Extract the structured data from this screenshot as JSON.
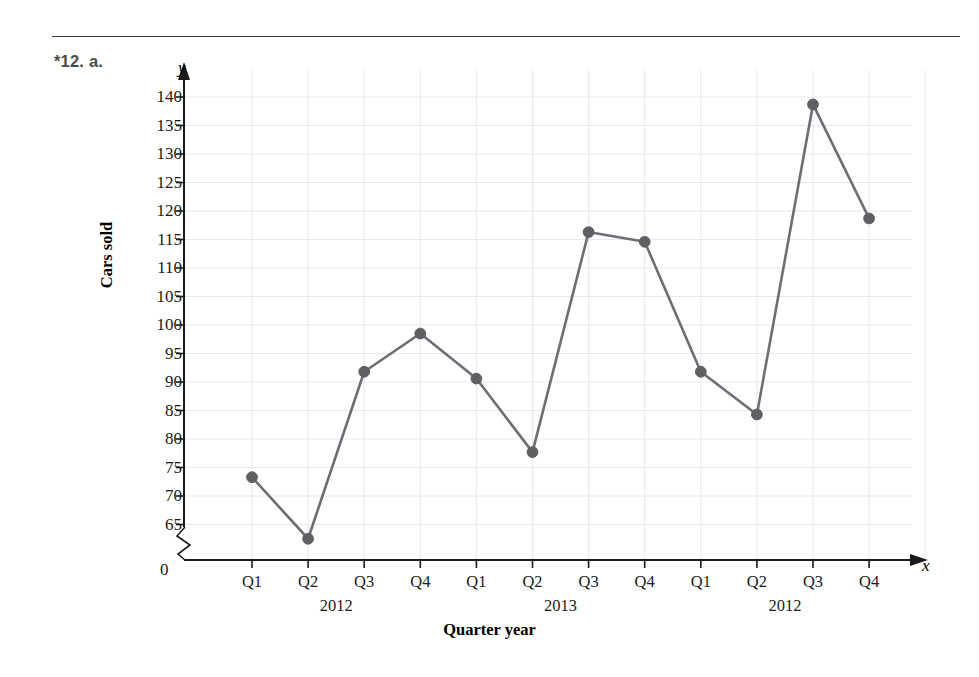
{
  "label": "*12. a.",
  "chart_data": {
    "type": "line",
    "title": "",
    "xlabel": "Quarter year",
    "ylabel": "Cars sold",
    "categories": [
      "Q1",
      "Q2",
      "Q3",
      "Q4",
      "Q1",
      "Q2",
      "Q3",
      "Q4",
      "Q1",
      "Q2",
      "Q3",
      "Q4"
    ],
    "values": [
      73.3,
      62.5,
      91.8,
      98.5,
      90.6,
      77.7,
      116.3,
      114.6,
      91.8,
      84.3,
      138.7,
      118.7
    ],
    "group_labels": [
      "2012",
      "2013",
      "2012"
    ],
    "ylim": [
      65,
      142
    ],
    "yticks": [
      65,
      70,
      75,
      80,
      85,
      90,
      95,
      100,
      105,
      110,
      115,
      120,
      125,
      130,
      135,
      140
    ],
    "origin_label": "0",
    "axis_letter_x": "x",
    "axis_letter_y": "y",
    "grid": true,
    "legend": "none",
    "axis_break": true,
    "series_color": "#6d6d74",
    "marker_color": "#5f5f66",
    "grid_color": "#e8e8ee",
    "axis_color": "#1a1a1a"
  }
}
